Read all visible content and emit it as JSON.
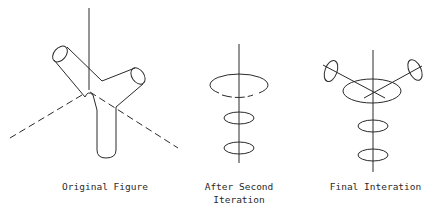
{
  "figures": [
    {
      "id": "original",
      "caption": "Original Figure"
    },
    {
      "id": "second",
      "caption_line1": "After Second",
      "caption_line2": "Iteration"
    },
    {
      "id": "final",
      "caption": "Final Interation"
    }
  ],
  "colors": {
    "stroke": "#2a2a2a",
    "background": "#ffffff"
  }
}
